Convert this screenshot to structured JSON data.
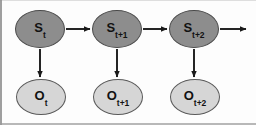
{
  "figure": {
    "background_color": "#fdfdfd",
    "state_fill_color": "#8d8d8d",
    "state_stroke_color": "#4a4a4a",
    "observation_fill_color": "#d6d6d6",
    "observation_stroke_color": "#5a5a5a",
    "arrow_color": "#1a1a1a"
  },
  "states": [
    {
      "id": "state-t",
      "symbol": "S",
      "subscript": "t",
      "cx": 40,
      "cy": 29,
      "rx": 25,
      "ry": 19
    },
    {
      "id": "state-t1",
      "symbol": "S",
      "subscript": "t+1",
      "cx": 117,
      "cy": 29,
      "rx": 25,
      "ry": 19
    },
    {
      "id": "state-t2",
      "symbol": "S",
      "subscript": "t+2",
      "cx": 194,
      "cy": 29,
      "rx": 25,
      "ry": 19
    }
  ],
  "observations": [
    {
      "id": "obs-t",
      "symbol": "O",
      "subscript": "t",
      "cx": 41,
      "cy": 97,
      "rx": 25,
      "ry": 18
    },
    {
      "id": "obs-t1",
      "symbol": "O",
      "subscript": "t+1",
      "cx": 118,
      "cy": 97,
      "rx": 25,
      "ry": 18
    },
    {
      "id": "obs-t2",
      "symbol": "O",
      "subscript": "t+2",
      "cx": 195,
      "cy": 97,
      "rx": 25,
      "ry": 18
    }
  ],
  "transition_arrows": [
    {
      "id": "arrow-state-t-to-t1",
      "x1": 66,
      "y1": 29,
      "x2": 90,
      "y2": 29
    },
    {
      "id": "arrow-state-t1-to-t2",
      "x1": 143,
      "y1": 29,
      "x2": 167,
      "y2": 29
    },
    {
      "id": "arrow-state-t2-out",
      "x1": 220,
      "y1": 29,
      "x2": 246,
      "y2": 29
    }
  ],
  "emission_arrows": [
    {
      "id": "arrow-state-t-to-obs-t",
      "x1": 40,
      "y1": 49,
      "x2": 40,
      "y2": 77
    },
    {
      "id": "arrow-state-t1-to-obs-t1",
      "x1": 117,
      "y1": 49,
      "x2": 117,
      "y2": 77
    },
    {
      "id": "arrow-state-t2-to-obs-t2",
      "x1": 194,
      "y1": 49,
      "x2": 194,
      "y2": 77
    }
  ],
  "icons": {
    "arrowhead": "triangle-arrowhead-icon"
  }
}
